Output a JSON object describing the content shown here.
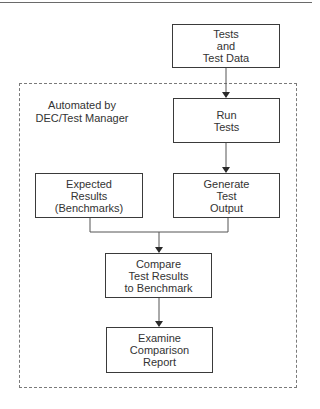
{
  "diagram": {
    "group": {
      "label": "Automated by\nDEC/Test Manager"
    },
    "nodes": [
      {
        "id": "tests-data",
        "label": "Tests\nand\nTest Data"
      },
      {
        "id": "run-tests",
        "label": "Run\nTests"
      },
      {
        "id": "expected-results",
        "label": "Expected\nResults\n(Benchmarks)"
      },
      {
        "id": "generate-output",
        "label": "Generate\nTest\nOutput"
      },
      {
        "id": "compare",
        "label": "Compare\nTest Results\nto Benchmark"
      },
      {
        "id": "examine",
        "label": "Examine\nComparison\nReport"
      }
    ],
    "edges": [
      {
        "from": "tests-data",
        "to": "run-tests"
      },
      {
        "from": "run-tests",
        "to": "generate-output"
      },
      {
        "from": "expected-results",
        "to": "compare"
      },
      {
        "from": "generate-output",
        "to": "compare"
      },
      {
        "from": "compare",
        "to": "examine"
      }
    ]
  }
}
